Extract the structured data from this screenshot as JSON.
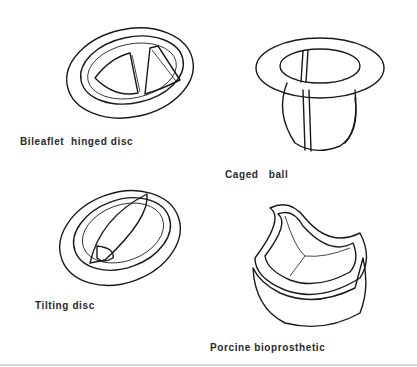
{
  "figure": {
    "panels": [
      {
        "id": "bileaflet",
        "label": "Bileaflet  hinged disc"
      },
      {
        "id": "caged-ball",
        "label": "Caged   ball"
      },
      {
        "id": "tilting",
        "label": "Tilting disc"
      },
      {
        "id": "porcine",
        "label": "Porcine bioprosthetic"
      }
    ]
  }
}
